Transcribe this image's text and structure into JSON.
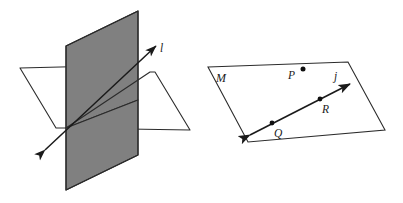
{
  "figure": {
    "background_color": "#ffffff",
    "width": 403,
    "height": 203
  },
  "left_figure": {
    "name": "intersecting-planes-figure",
    "description": "Two planes intersecting in line l",
    "planes": [
      {
        "id": "vertical-plane",
        "shade": "dark",
        "fill_color": "#808080",
        "stroke_color": "#2b2b2b",
        "points": "66,46 138,11 138,155 66,190"
      },
      {
        "id": "horizontal-plane-left-wing",
        "shade": "light",
        "fill_color": "#c8c8c8",
        "stroke_color": "#2b2b2b",
        "points": "20,68 101,66 66,128 56,128"
      },
      {
        "id": "horizontal-plane-right-wing",
        "shade": "light",
        "fill_color": "#c8c8c8",
        "stroke_color": "#2b2b2b",
        "points": "66,128 150,72 155,72 190,130"
      }
    ],
    "intersection_line": {
      "id": "line-l",
      "label": "l",
      "x1": 45,
      "y1": 150,
      "x2": 156,
      "y2": 46,
      "double_arrow": true,
      "stroke_color": "#1a1a1a"
    },
    "label": {
      "text": "l",
      "x": 160,
      "y": 50
    }
  },
  "right_figure": {
    "name": "plane-m-with-line-j-figure",
    "description": "Plane M containing line j through points Q and R, and point P not on line j",
    "plane": {
      "id": "plane-M",
      "label": "M",
      "fill_color": "#ffffff",
      "stroke_color": "#2b2b2b",
      "points": "208,67 348,62 385,130 248,142"
    },
    "plane_label": {
      "text": "M",
      "x": 216,
      "y": 82
    },
    "line": {
      "id": "line-j",
      "label": "j",
      "x1": 250,
      "y1": 135,
      "x2": 350,
      "y2": 84,
      "double_arrow": true,
      "stroke_color": "#1a1a1a"
    },
    "line_label": {
      "text": "j",
      "x": 334,
      "y": 80
    },
    "points": [
      {
        "id": "point-P",
        "label": "P",
        "dot_x": 303,
        "dot_y": 69,
        "label_x": 288,
        "label_y": 79,
        "on_line": false
      },
      {
        "id": "point-Q",
        "label": "Q",
        "dot_x": 272,
        "dot_y": 123,
        "label_x": 274,
        "label_y": 137,
        "on_line": true
      },
      {
        "id": "point-R",
        "label": "R",
        "dot_x": 320,
        "dot_y": 99,
        "label_x": 322,
        "label_y": 113,
        "on_line": true
      }
    ]
  },
  "colors": {
    "dark_plane": "#808080",
    "light_plane": "#c8c8c8",
    "outline": "#2b2b2b",
    "ink": "#1a1a1a",
    "background": "#ffffff"
  }
}
